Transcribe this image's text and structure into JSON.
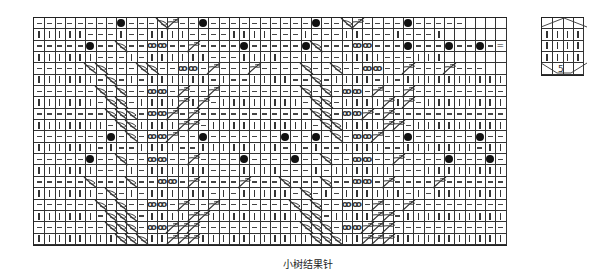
{
  "caption": "小树结果针",
  "legend": {
    "label_number": "5",
    "rows": 5,
    "cols": 4,
    "description": "bobble: knit 5 rows on 5 stitches then decrease"
  },
  "symbols": {
    "p": "purl (—)",
    "k": "knit (|)",
    "b": "bobble (●)",
    "t": "twisted cross (ꝏ)",
    "r": "right-leaning cross",
    "l": "left-leaning cross",
    "e": "empty",
    "q": "equal sign (=)"
  },
  "colors": {
    "grid": "#333333",
    "symbol": "#222222",
    "background": "#ffffff"
  },
  "grid": {
    "cols": 46,
    "rows": [
      "ppppppppbppplrppbppppppppppbpplrppppbpppppeeee",
      "kkkkkpppkppkkkkppppkkkkpppkpppkkpppkpppkeeeeee",
      "pppppbpplppttpprppppbpppppblpppttpppbpppbppbpq",
      "kkkkkkpppkpkkkkkkpppkkkkppkpppkkkkpppkkkeeeeee",
      "pppppllpppllppttprppprpppplpplppttpprppprpppee",
      "kkkkkkplpkpkkkkkkpkppkkkkpplpkkkkpkpkkkkkkkkkk",
      "pppppplplppttprpprpppppppplplpttprpprppppppppp",
      "kkkkkkpllpkkkkrkrpkkkkkkkkpllpkkkkrkrpkkkkkkkk",
      "ppppppplllpttrprpppppppppppllpttrprppppppppppp",
      "kkkkkkkpllkkkkrrpkkkkkkkkkkpllkkkkrrpkkkkkkkkk",
      "pppppppbplpttrppbpppppppbppbplpttrppbppppppbpp",
      "kkkkkkpkppkkkkppkkkkkkkkpkpkppkkkkppkkkkkkkpkk",
      "pppppbpplppttpprppppbppppbpplppttpprppppbpppbp",
      "kkkkkkpppkpkkkkkkpppkkkkpppkpkkkkkkpppkkkkkkkk",
      "ppppplppplppttprpppprppplppplppttprpppprpppppp",
      "kkkkkkplpkpkkkkkkpkpkkkkkplpkpkkkkkkpkpkkkkkkk",
      "pppppplplppttprpprppppppplplppttprpprppppppppp",
      "kkkkkkplllpkkkkrrkkkkkkkkkllpkkkkrrpkkkkkkkkkk",
      "ppppppplllpttrrrpppppppppplllpttrrrppppppppppp",
      "kkkkkkkklllkkrrrkkkkkkkkkkklllkkrrrkkkkkkkkkkk"
    ]
  }
}
